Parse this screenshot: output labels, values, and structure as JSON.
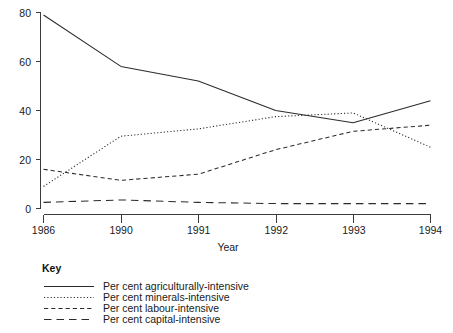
{
  "chart_data": {
    "type": "line",
    "title": "",
    "xlabel": "Year",
    "ylabel": "",
    "categories": [
      "1986",
      "1990",
      "1991",
      "1992",
      "1993",
      "1994"
    ],
    "x": [
      1986,
      1990,
      1991,
      1992,
      1993,
      1994
    ],
    "xlim": [
      0,
      5
    ],
    "ylim": [
      0,
      80
    ],
    "yticks": [
      0,
      20,
      40,
      60,
      80
    ],
    "ytick_labels": [
      "0",
      "20",
      "40",
      "60",
      "80"
    ],
    "xtick_labels": [
      "1986",
      "1990",
      "1991",
      "1992",
      "1993",
      "1994"
    ],
    "grid": false,
    "legend_position": "below-left",
    "legend_title": "Key",
    "series": [
      {
        "name": "Per cent agriculturally-intensive",
        "style": "solid",
        "values": [
          79,
          58,
          52,
          40,
          35,
          44
        ]
      },
      {
        "name": "Per cent minerals-intensive",
        "style": "dotted",
        "values": [
          9,
          29.5,
          32.5,
          37.5,
          39,
          25
        ]
      },
      {
        "name": "Per cent labour-intensive",
        "style": "dashed",
        "values": [
          16,
          11.5,
          14,
          24,
          31.5,
          34
        ]
      },
      {
        "name": "Per cent capital-intensive",
        "style": "long-dash",
        "values": [
          2.5,
          3.5,
          2.5,
          2,
          2,
          2
        ]
      }
    ]
  },
  "axis": {
    "x_title": "Year",
    "y_ticks": [
      "80",
      "60",
      "40",
      "20",
      "0"
    ],
    "x_ticks": [
      "1986",
      "1990",
      "1991",
      "1992",
      "1993",
      "1994"
    ]
  },
  "key": {
    "heading": "Key",
    "entries": [
      {
        "label": "Per cent agriculturally-intensive",
        "dash": "none"
      },
      {
        "label": "Per cent minerals-intensive",
        "dash": "1.2 2.1"
      },
      {
        "label": "Per cent labour-intensive",
        "dash": "4.2 3"
      },
      {
        "label": "Per cent capital-intensive",
        "dash": "7.5 5"
      }
    ]
  },
  "colors": {
    "ink": "#2b2b2b",
    "axis": "#3c3c3c",
    "background": "#ffffff"
  }
}
